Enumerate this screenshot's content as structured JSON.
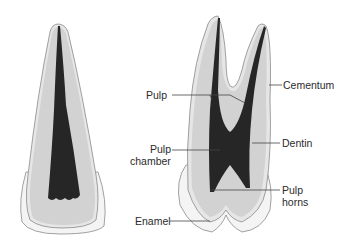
{
  "figure": {
    "teeth": [
      "incisor",
      "molar"
    ]
  },
  "labels": {
    "pulp": "Pulp",
    "cementum": "Cementum",
    "pulp_chamber_line1": "Pulp",
    "pulp_chamber_line2": "chamber",
    "dentin": "Dentin",
    "pulp_horns_line1": "Pulp",
    "pulp_horns_line2": "horns",
    "enamel": "Enamel"
  },
  "colors": {
    "enamel": "#f4f4f4",
    "dentin": "#d2d2d2",
    "cementum": "#e6e6e6",
    "pulp": "#262626",
    "outline": "#8a8a8a",
    "leader": "#444444"
  }
}
